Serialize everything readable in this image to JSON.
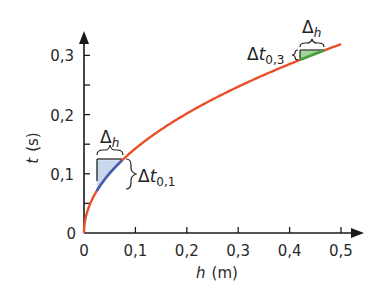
{
  "chart_data": {
    "type": "line",
    "title": "",
    "xlabel": "h (m)",
    "xlabel_var": "h",
    "xlabel_unit": "(m)",
    "ylabel": "t (s)",
    "ylabel_var": "t",
    "ylabel_unit": "(s)",
    "xlim": [
      0,
      0.5
    ],
    "ylim": [
      0,
      0.33
    ],
    "grid": false,
    "x_ticks": [
      "0",
      "0,1",
      "0,2",
      "0,3",
      "0,4",
      "0,5"
    ],
    "y_ticks": [
      "0",
      "0,1",
      "0,2",
      "0,3"
    ],
    "series": [
      {
        "name": "t(h)",
        "color": "#e8502a",
        "x": [
          0,
          0.005,
          0.01,
          0.02,
          0.03,
          0.05,
          0.075,
          0.1,
          0.15,
          0.2,
          0.25,
          0.3,
          0.35,
          0.4,
          0.45,
          0.5
        ],
        "values": [
          0,
          0.032,
          0.045,
          0.064,
          0.078,
          0.101,
          0.124,
          0.143,
          0.175,
          0.202,
          0.226,
          0.247,
          0.267,
          0.286,
          0.303,
          0.319
        ]
      }
    ],
    "annotations": [
      {
        "label": "Δh",
        "sub": "",
        "region": "near h=0..0.075",
        "color": "#3a5fbf",
        "fill": "#c9d8ee"
      },
      {
        "label": "Δt",
        "sub": "0,1",
        "region": "t from 0.07 to 0.124"
      },
      {
        "label": "Δh",
        "sub": "",
        "region": "near h=0.42..0.47",
        "color": "#3aa640",
        "fill": "#9dd49a"
      },
      {
        "label": "Δt",
        "sub": "0,3",
        "region": "t from 0.295 to 0.31"
      }
    ]
  },
  "labels": {
    "delta": "Δ",
    "h": "h",
    "t": "t",
    "dt1_sub": "0,1",
    "dt3_sub": "0,3"
  },
  "colors": {
    "curve": "#e8502a",
    "segment1": "#3a5fbf",
    "fill1": "#c9d8ee",
    "segment3": "#3aa640",
    "fill3": "#9dd49a",
    "axis": "#1a1a1a"
  }
}
